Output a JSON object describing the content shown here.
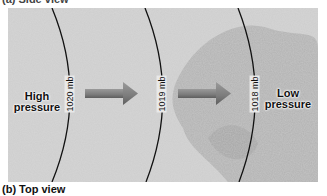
{
  "header": {
    "partial_caption": "(a) Side view"
  },
  "diagram": {
    "high_label": [
      "High",
      "pressure"
    ],
    "low_label": [
      "Low",
      "pressure"
    ],
    "isobars": [
      {
        "label": "1020 mb"
      },
      {
        "label": "1019 mb"
      },
      {
        "label": "1018 mb"
      }
    ],
    "arrow_count": 2,
    "colors": {
      "background": "#c9c9c9",
      "dark_region": "#a9a9a9",
      "arrow": "#8a8a8a",
      "isobar": "#111111"
    }
  },
  "caption": "(b) Top view"
}
